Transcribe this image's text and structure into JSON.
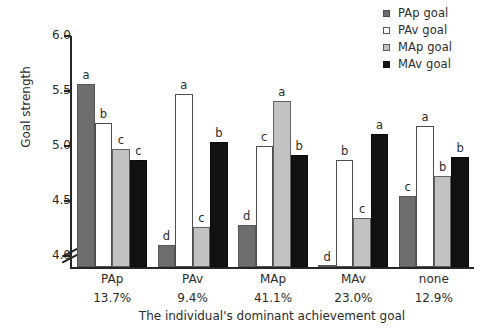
{
  "chart_data": {
    "type": "bar",
    "title": "",
    "xlabel": "The individual's dominant achievement goal",
    "ylabel": "Goal strength",
    "ylim": [
      3.9,
      6.0
    ],
    "yticks": [
      4.0,
      4.5,
      5.0,
      5.5,
      6.0
    ],
    "ytick_labels": [
      "4.0",
      "4.5",
      "5.0",
      "5.5",
      "6.0"
    ],
    "axis_break": true,
    "grid": false,
    "legend_position": "top-right",
    "categories": [
      "PAp",
      "PAv",
      "MAp",
      "MAv",
      "none"
    ],
    "category_percentages": [
      "13.7%",
      "9.4%",
      "41.1%",
      "23.0%",
      "12.9%"
    ],
    "series": [
      {
        "name": "PAp goal",
        "color": "#6e6e6e",
        "style": "dark",
        "values": [
          5.56,
          4.1,
          4.28,
          3.66,
          4.55
        ],
        "annotations": [
          "a",
          "d",
          "d",
          "d",
          "c"
        ]
      },
      {
        "name": "PAv goal",
        "color": "#ffffff",
        "style": "white",
        "values": [
          5.21,
          5.47,
          5.0,
          4.87,
          5.18
        ],
        "annotations": [
          "b",
          "a",
          "c",
          "b",
          "a"
        ]
      },
      {
        "name": "MAp goal",
        "color": "#c2c2c2",
        "style": "light",
        "values": [
          4.97,
          4.26,
          5.41,
          4.35,
          4.73
        ],
        "annotations": [
          "c",
          "c",
          "a",
          "c",
          "b"
        ]
      },
      {
        "name": "MAv goal",
        "color": "#121212",
        "style": "black",
        "values": [
          4.87,
          5.04,
          4.92,
          5.11,
          4.9
        ],
        "annotations": [
          "c",
          "b",
          "b",
          "a",
          "b"
        ]
      }
    ]
  },
  "legend": {
    "items": [
      {
        "label": "PAp goal",
        "swatch": "sw-dark"
      },
      {
        "label": "PAv goal",
        "swatch": "sw-white"
      },
      {
        "label": "MAp goal",
        "swatch": "sw-light"
      },
      {
        "label": "MAv goal",
        "swatch": "sw-black"
      }
    ]
  }
}
